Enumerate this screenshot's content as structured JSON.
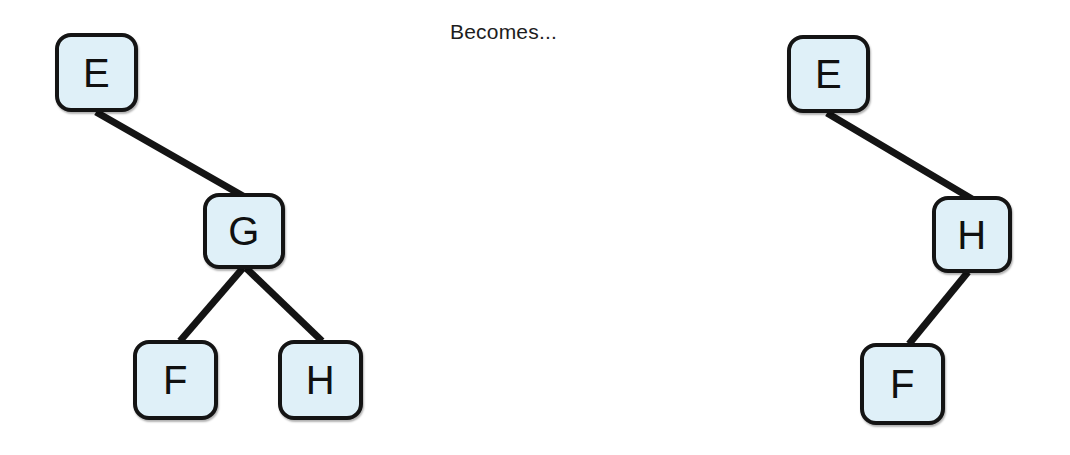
{
  "page": {
    "background": "#ffffff",
    "width": 1070,
    "height": 455
  },
  "caption": {
    "text": "Becomes..."
  },
  "style": {
    "node_fill": "#dff0f8",
    "node_border": "#141414",
    "edge_color": "#141414",
    "label_color": "#101010"
  },
  "diagram": {
    "type": "tree-transformation",
    "left_tree": {
      "name": "before",
      "root": "E",
      "nodes": [
        {
          "id": "E",
          "label": "E",
          "x": 55,
          "y": 33,
          "w": 83,
          "h": 79
        },
        {
          "id": "G",
          "label": "G",
          "x": 203,
          "y": 193,
          "w": 82,
          "h": 76
        },
        {
          "id": "F",
          "label": "F",
          "x": 133,
          "y": 340,
          "w": 85,
          "h": 80
        },
        {
          "id": "H",
          "label": "H",
          "x": 278,
          "y": 340,
          "w": 85,
          "h": 80
        }
      ],
      "edges": [
        {
          "from": "E",
          "to": "G",
          "x1": 96,
          "y1": 112,
          "x2": 243,
          "y2": 196
        },
        {
          "from": "G",
          "to": "F",
          "x1": 243,
          "y1": 268,
          "x2": 180,
          "y2": 341
        },
        {
          "from": "G",
          "to": "H",
          "x1": 246,
          "y1": 268,
          "x2": 322,
          "y2": 341
        }
      ]
    },
    "right_tree": {
      "name": "after",
      "root": "E",
      "nodes": [
        {
          "id": "E",
          "label": "E",
          "x": 787,
          "y": 35,
          "w": 83,
          "h": 78
        },
        {
          "id": "H",
          "label": "H",
          "x": 932,
          "y": 196,
          "w": 80,
          "h": 77
        },
        {
          "id": "F",
          "label": "F",
          "x": 860,
          "y": 343,
          "w": 85,
          "h": 82
        }
      ],
      "edges": [
        {
          "from": "E",
          "to": "H",
          "x1": 827,
          "y1": 113,
          "x2": 972,
          "y2": 199
        },
        {
          "from": "H",
          "to": "F",
          "x1": 968,
          "y1": 272,
          "x2": 909,
          "y2": 344
        }
      ]
    }
  }
}
